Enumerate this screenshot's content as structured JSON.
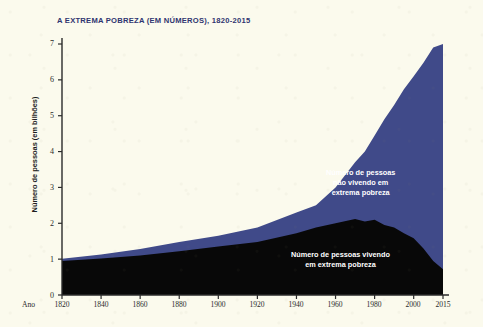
{
  "chart_data": {
    "type": "area",
    "title": "A EXTREMA POBREZA (EM NÚMEROS), 1820-2015",
    "xlabel": "Ano",
    "ylabel": "Número de pessoas (em bilhões)",
    "xlim": [
      1820,
      2015
    ],
    "ylim": [
      0,
      7
    ],
    "grid": false,
    "stacked": true,
    "legend_position": "inline-annotation",
    "y_ticks": [
      "7",
      "6",
      "5",
      "4",
      "3",
      "2",
      "1",
      "0"
    ],
    "y_tick_values": [
      7,
      6,
      5,
      4,
      3,
      2,
      1,
      0
    ],
    "x_ticks": [
      "1820",
      "1840",
      "1860",
      "1880",
      "1900",
      "1920",
      "1940",
      "1960",
      "1980",
      "2000",
      "2015"
    ],
    "x_tick_values": [
      1820,
      1840,
      1860,
      1880,
      1900,
      1920,
      1940,
      1960,
      1980,
      2000,
      2015
    ],
    "x": [
      1820,
      1840,
      1860,
      1880,
      1900,
      1920,
      1940,
      1950,
      1960,
      1970,
      1975,
      1980,
      1985,
      1990,
      1995,
      2000,
      2005,
      2010,
      2015
    ],
    "series": [
      {
        "name": "Número de pessoas vivendo em extrema pobreza",
        "color": "#080808",
        "values": [
          0.95,
          1.02,
          1.1,
          1.22,
          1.35,
          1.48,
          1.72,
          1.88,
          2.0,
          2.12,
          2.05,
          2.1,
          1.95,
          1.88,
          1.72,
          1.58,
          1.3,
          0.95,
          0.72
        ]
      },
      {
        "name": "Número de pessoas não vivendo em extrema pobreza",
        "color": "#404a89",
        "values": [
          0.06,
          0.11,
          0.18,
          0.26,
          0.3,
          0.4,
          0.58,
          0.62,
          1.0,
          1.58,
          1.95,
          2.35,
          2.95,
          3.42,
          4.02,
          4.52,
          5.18,
          5.95,
          6.28
        ]
      }
    ],
    "totals": [
      1.01,
      1.13,
      1.28,
      1.48,
      1.65,
      1.88,
      2.3,
      2.5,
      3.0,
      3.7,
      4.0,
      4.45,
      4.9,
      5.3,
      5.74,
      6.1,
      6.48,
      6.9,
      7.0
    ],
    "annotations": [
      {
        "name": "non-poor-label",
        "text_lines": [
          "Número de pessoas",
          "não vivendo em",
          "extrema pobreza"
        ]
      },
      {
        "name": "poor-label",
        "text_lines": [
          "Número de pessoas vivendo",
          "em extrema pobreza"
        ]
      }
    ]
  },
  "colors": {
    "background": "#fbfaed",
    "poverty_area": "#080808",
    "non_poverty_area": "#404a89",
    "title_text": "#2f3570",
    "axis": "#2a2a2a"
  }
}
